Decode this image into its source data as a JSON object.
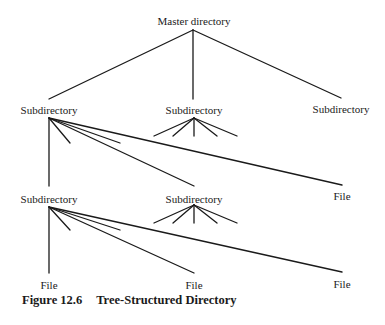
{
  "diagram": {
    "title": "Tree-Structured Directory",
    "nodes": {
      "root": {
        "label": "Master directory"
      },
      "sub_left": {
        "label": "Subdirectory"
      },
      "sub_middle": {
        "label": "Subdirectory"
      },
      "sub_right": {
        "label": "Subdirectory"
      },
      "sub_left_sub": {
        "label": "Subdirectory"
      },
      "sub_mid2": {
        "label": "Subdirectory"
      },
      "file_right1": {
        "label": "File"
      },
      "file_bl": {
        "label": "File"
      },
      "file_bm": {
        "label": "File"
      },
      "file_br": {
        "label": "File"
      }
    },
    "edges": [
      [
        "root",
        "sub_left"
      ],
      [
        "root",
        "sub_middle"
      ],
      [
        "root",
        "sub_right"
      ],
      [
        "sub_left",
        "sub_left_sub"
      ],
      [
        "sub_left",
        "sub_mid2"
      ],
      [
        "sub_left",
        "file_right1"
      ],
      [
        "sub_left_sub",
        "file_bl"
      ],
      [
        "sub_left_sub",
        "file_bm"
      ],
      [
        "sub_left_sub",
        "file_br"
      ]
    ]
  },
  "caption": {
    "number": "Figure 12.6",
    "text": "Tree-Structured Directory"
  },
  "colors": {
    "line": "#1a1a1a",
    "background": "#ffffff"
  }
}
